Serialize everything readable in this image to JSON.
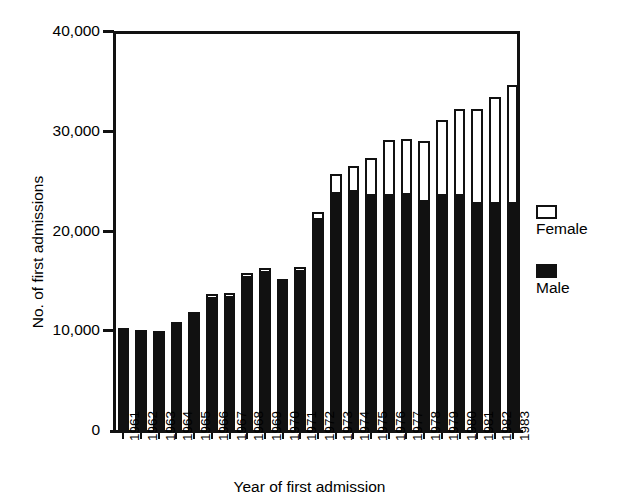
{
  "chart_data": {
    "type": "bar",
    "subtype": "stacked-bar",
    "title": "",
    "xlabel": "Year of first admission",
    "ylabel": "No. of first admissions",
    "ylim": [
      0,
      40000
    ],
    "ytick_labels": [
      "40,000",
      "30,000",
      "20,000",
      "10,000",
      "0"
    ],
    "ytick_values": [
      40000,
      30000,
      20000,
      10000,
      0
    ],
    "grid": false,
    "legend_position": "right",
    "categories": [
      "1961",
      "1962",
      "1963",
      "1964",
      "1965",
      "1966",
      "1967",
      "1968",
      "1969",
      "1970",
      "1971",
      "1972",
      "1973",
      "1974",
      "1975",
      "1976",
      "1977",
      "1978",
      "1979",
      "1980",
      "1981",
      "1982",
      "1983"
    ],
    "series": [
      {
        "name": "Male",
        "color": "#111111",
        "values": [
          10200,
          10000,
          9900,
          10800,
          11800,
          13200,
          13300,
          15300,
          15800,
          14800,
          15900,
          21200,
          23800,
          24000,
          23600,
          23600,
          23700,
          23000,
          23600,
          23600,
          22800,
          22800,
          22800
        ]
      },
      {
        "name": "Female",
        "color": "#ffffff",
        "values": [
          0,
          0,
          0,
          0,
          0,
          300,
          300,
          300,
          300,
          200,
          300,
          600,
          1800,
          2400,
          3600,
          5400,
          5400,
          5900,
          7400,
          8500,
          9300,
          10500,
          11700
        ]
      }
    ],
    "totals": [
      10200,
      10000,
      9900,
      10800,
      11800,
      13500,
      13600,
      15600,
      16100,
      15000,
      16200,
      21800,
      25600,
      26400,
      27200,
      29000,
      29100,
      28900,
      31000,
      32100,
      32100,
      33300,
      34500
    ]
  },
  "legend": {
    "items": [
      {
        "label": "Female",
        "swatch": "open-square-icon"
      },
      {
        "label": "Male",
        "swatch": "filled-square-icon"
      }
    ]
  }
}
